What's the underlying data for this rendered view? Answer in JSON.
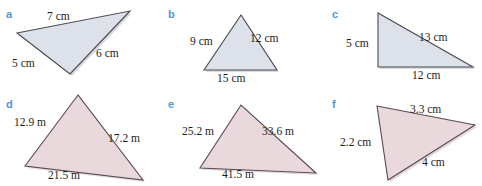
{
  "page": {
    "background": "#ffffff",
    "label_color": "#4c9ad4",
    "text_color": "#1c1c1c",
    "fill_top": "#dde1ea",
    "fill_bottom": "#e9d8dc",
    "stroke": "#4a4a52"
  },
  "figures": [
    {
      "key": "a",
      "letter": "a",
      "letter_pos": {
        "x": 6,
        "y": 9
      },
      "fill": "#dde1ea",
      "points": "17,33 130,11 70,74",
      "side_labels": [
        {
          "text": "7 cm",
          "x": 47,
          "y": 11
        },
        {
          "text": "6 cm",
          "x": 96,
          "y": 48
        },
        {
          "text": "5 cm",
          "x": 12,
          "y": 58
        }
      ]
    },
    {
      "key": "b",
      "letter": "b",
      "letter_pos": {
        "x": 168,
        "y": 9
      },
      "fill": "#dde1ea",
      "points": "241,15 204,70 277,70",
      "side_labels": [
        {
          "text": "9 cm",
          "x": 190,
          "y": 36
        },
        {
          "text": "12 cm",
          "x": 250,
          "y": 33
        },
        {
          "text": "15 cm",
          "x": 217,
          "y": 73
        }
      ]
    },
    {
      "key": "c",
      "letter": "c",
      "letter_pos": {
        "x": 332,
        "y": 9
      },
      "fill": "#dde1ea",
      "points": "378,13 378,67 473,67",
      "side_labels": [
        {
          "text": "13 cm",
          "x": 419,
          "y": 32
        },
        {
          "text": "5 cm",
          "x": 346,
          "y": 38
        },
        {
          "text": "12 cm",
          "x": 412,
          "y": 70
        }
      ]
    },
    {
      "key": "d",
      "letter": "d",
      "letter_pos": {
        "x": 6,
        "y": 99
      },
      "fill": "#e9d8dc",
      "points": "78,95 25,166 143,180",
      "side_labels": [
        {
          "text": "12.9 m",
          "x": 14,
          "y": 117
        },
        {
          "text": "17.2 m",
          "x": 108,
          "y": 133
        },
        {
          "text": "21.5 m",
          "x": 48,
          "y": 170
        }
      ]
    },
    {
      "key": "e",
      "letter": "e",
      "letter_pos": {
        "x": 168,
        "y": 99
      },
      "fill": "#e9d8dc",
      "points": "241,105 200,168 316,173",
      "side_labels": [
        {
          "text": "25.2 m",
          "x": 182,
          "y": 126
        },
        {
          "text": "33.6 m",
          "x": 262,
          "y": 126
        },
        {
          "text": "41.5 m",
          "x": 222,
          "y": 169
        }
      ]
    },
    {
      "key": "f",
      "letter": "f",
      "letter_pos": {
        "x": 332,
        "y": 99
      },
      "fill": "#e9d8dc",
      "points": "377,106 475,125 388,180",
      "side_labels": [
        {
          "text": "3.3 cm",
          "x": 410,
          "y": 104
        },
        {
          "text": "2.2 cm",
          "x": 340,
          "y": 137
        },
        {
          "text": "4 cm",
          "x": 422,
          "y": 157
        }
      ]
    }
  ]
}
